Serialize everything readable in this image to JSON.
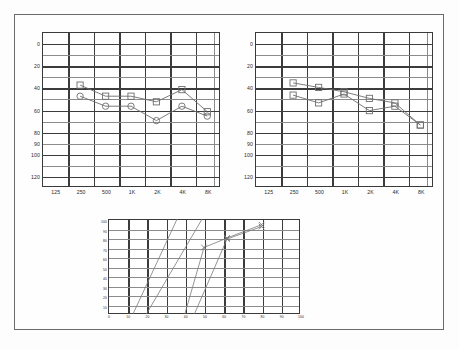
{
  "document": {
    "kind": "audiometry-report",
    "frame_color": "#6b6b6b"
  },
  "chart_data": [
    {
      "id": "audiogram-right",
      "type": "line",
      "title": "Audiogram 1",
      "xlabel": "",
      "ylabel": "",
      "grid": true,
      "legend_position": "none",
      "categories": [
        "125",
        "250",
        "500",
        "1K",
        "2K",
        "4K",
        "8K"
      ],
      "ytick_labels": [
        "0",
        "20",
        "40",
        "60",
        "80",
        "90",
        "100",
        "120"
      ],
      "ytick_values": [
        0,
        20,
        40,
        60,
        80,
        90,
        100,
        120
      ],
      "ylim": [
        -10,
        130
      ],
      "series": [
        {
          "name": "Air conduction",
          "marker": "circle",
          "color": "#6e6e6e",
          "x": [
            "250",
            "500",
            "1K",
            "2K",
            "4K",
            "8K"
          ],
          "values": [
            48,
            57,
            57,
            70,
            57,
            66
          ]
        },
        {
          "name": "Bone conduction",
          "marker": "square",
          "color": "#6e6e6e",
          "x": [
            "250",
            "500",
            "1K",
            "2K",
            "4K",
            "8K"
          ],
          "values": [
            38,
            48,
            48,
            53,
            42,
            62
          ]
        }
      ]
    },
    {
      "id": "audiogram-left",
      "type": "line",
      "title": "Audiogram 2",
      "xlabel": "",
      "ylabel": "",
      "grid": true,
      "legend_position": "none",
      "categories": [
        "125",
        "250",
        "500",
        "1K",
        "2K",
        "4K",
        "8K"
      ],
      "ytick_labels": [
        "0",
        "20",
        "40",
        "60",
        "80",
        "90",
        "100",
        "120"
      ],
      "ytick_values": [
        0,
        20,
        40,
        60,
        80,
        90,
        100,
        120
      ],
      "ylim": [
        -10,
        130
      ],
      "series": [
        {
          "name": "Air conduction",
          "marker": "square",
          "color": "#6e6e6e",
          "x": [
            "250",
            "500",
            "1K",
            "2K",
            "4K",
            "8K"
          ],
          "values": [
            47,
            54,
            46,
            61,
            57,
            74
          ]
        },
        {
          "name": "Bone conduction",
          "marker": "square",
          "color": "#6e6e6e",
          "x": [
            "250",
            "500",
            "1K",
            "2K",
            "4K",
            "8K"
          ],
          "values": [
            36,
            40,
            44,
            50,
            54,
            74
          ]
        }
      ]
    },
    {
      "id": "speech-discrimination",
      "type": "line",
      "title": "Speech Discrimination",
      "xlabel": "",
      "ylabel": "",
      "grid": true,
      "legend_position": "none",
      "xtick_labels": [
        "0",
        "10",
        "20",
        "30",
        "40",
        "50",
        "60",
        "70",
        "80",
        "90",
        "100"
      ],
      "xtick_values": [
        0,
        10,
        20,
        30,
        40,
        50,
        60,
        70,
        80,
        90,
        100
      ],
      "ytick_labels": [
        "100",
        "90",
        "80",
        "70",
        "60",
        "50",
        "40",
        "30",
        "20",
        "10",
        "0"
      ],
      "ytick_values": [
        100,
        90,
        80,
        70,
        60,
        50,
        40,
        30,
        20,
        10,
        0
      ],
      "xlim": [
        0,
        100
      ],
      "ylim": [
        0,
        100
      ],
      "series": [
        {
          "name": "Reference curve A",
          "marker": "none",
          "color": "#7a7a7a",
          "x": [
            13,
            36
          ],
          "values": [
            0,
            100
          ]
        },
        {
          "name": "Reference curve B",
          "marker": "none",
          "color": "#7a7a7a",
          "x": [
            20,
            49
          ],
          "values": [
            0,
            100
          ]
        },
        {
          "name": "Speech curve right",
          "marker": "cross",
          "color": "#7a7a7a",
          "x": [
            40,
            50,
            62,
            80
          ],
          "values": [
            0,
            70,
            80,
            94
          ]
        },
        {
          "name": "Speech curve left",
          "marker": "cross",
          "color": "#7a7a7a",
          "x": [
            45,
            62,
            80
          ],
          "values": [
            0,
            79,
            92
          ]
        }
      ]
    }
  ]
}
